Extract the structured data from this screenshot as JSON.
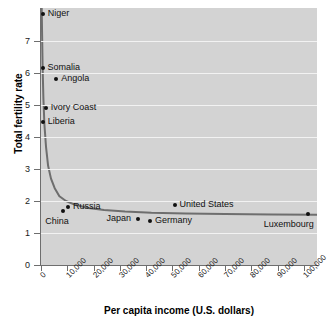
{
  "chart_data": {
    "type": "scatter",
    "title": "",
    "xlabel": "Per capita income (U.S. dollars)",
    "ylabel": "Total fertility rate",
    "xlim": [
      0,
      105000
    ],
    "ylim": [
      0,
      8.03
    ],
    "grid": true,
    "legend": "none",
    "xticks": [
      {
        "value": 0,
        "label": "0"
      },
      {
        "value": 10000,
        "label": "10,000"
      },
      {
        "value": 20000,
        "label": "20,000"
      },
      {
        "value": 30000,
        "label": "30,000"
      },
      {
        "value": 40000,
        "label": "40,000"
      },
      {
        "value": 50000,
        "label": "50,000"
      },
      {
        "value": 60000,
        "label": "60,000"
      },
      {
        "value": 70000,
        "label": "70,000"
      },
      {
        "value": 80000,
        "label": "80,000"
      },
      {
        "value": 90000,
        "label": "90,000"
      },
      {
        "value": 100000,
        "label": "100,000"
      }
    ],
    "yticks": [
      {
        "value": 0,
        "label": "0"
      },
      {
        "value": 1,
        "label": "1"
      },
      {
        "value": 2,
        "label": "2"
      },
      {
        "value": 3,
        "label": "3"
      },
      {
        "value": 4,
        "label": "4"
      },
      {
        "value": 5,
        "label": "5"
      },
      {
        "value": 6,
        "label": "6"
      },
      {
        "value": 7,
        "label": "7"
      }
    ],
    "points": [
      {
        "name": "Niger",
        "x": 700,
        "y": 7.85,
        "label_pos": "right"
      },
      {
        "name": "Somalia",
        "x": 600,
        "y": 6.15,
        "label_pos": "right"
      },
      {
        "name": "Angola",
        "x": 5800,
        "y": 5.8,
        "label_pos": "right"
      },
      {
        "name": "Ivory Coast",
        "x": 1800,
        "y": 4.9,
        "label_pos": "right"
      },
      {
        "name": "Liberia",
        "x": 700,
        "y": 4.47,
        "label_pos": "right"
      },
      {
        "name": "Russia",
        "x": 10300,
        "y": 1.81,
        "label_pos": "right"
      },
      {
        "name": "China",
        "x": 8500,
        "y": 1.69,
        "label_pos": "below-left"
      },
      {
        "name": "Japan",
        "x": 36700,
        "y": 1.44,
        "label_pos": "left"
      },
      {
        "name": "Germany",
        "x": 41500,
        "y": 1.39,
        "label_pos": "right"
      },
      {
        "name": "United States",
        "x": 50800,
        "y": 1.89,
        "label_pos": "right"
      },
      {
        "name": "Luxembourg",
        "x": 101500,
        "y": 1.6,
        "label_pos": "below-left"
      }
    ],
    "trend_curve": {
      "description": "fitted decreasing hyperbolic curve approaching an asymptote near 1.55",
      "points": [
        {
          "x": 260,
          "y": 8.03
        },
        {
          "x": 400,
          "y": 7.2
        },
        {
          "x": 600,
          "y": 6.2
        },
        {
          "x": 900,
          "y": 5.2
        },
        {
          "x": 1300,
          "y": 4.4
        },
        {
          "x": 1900,
          "y": 3.7
        },
        {
          "x": 2700,
          "y": 3.1
        },
        {
          "x": 3800,
          "y": 2.7
        },
        {
          "x": 5200,
          "y": 2.4
        },
        {
          "x": 7000,
          "y": 2.15
        },
        {
          "x": 9500,
          "y": 2.0
        },
        {
          "x": 13000,
          "y": 1.88
        },
        {
          "x": 18000,
          "y": 1.78
        },
        {
          "x": 24000,
          "y": 1.72
        },
        {
          "x": 32000,
          "y": 1.67
        },
        {
          "x": 42000,
          "y": 1.63
        },
        {
          "x": 55000,
          "y": 1.61
        },
        {
          "x": 70000,
          "y": 1.59
        },
        {
          "x": 88000,
          "y": 1.58
        },
        {
          "x": 105000,
          "y": 1.57
        }
      ]
    },
    "colors": {
      "plot_background": "#d3d3d3",
      "gridline": "#f2f2f2",
      "axis": "#6e6e6e",
      "point": "#111111",
      "trend_line": "#6e6e6e",
      "text": "#111111"
    }
  }
}
